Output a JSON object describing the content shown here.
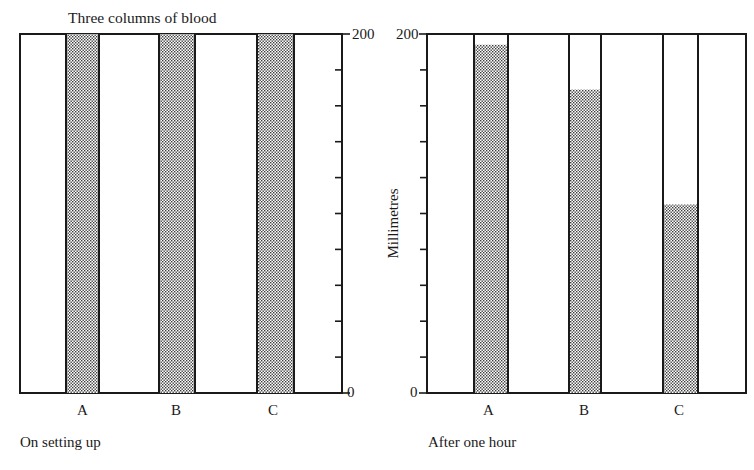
{
  "figure": {
    "title": "Three columns of blood",
    "y_axis_label": "Millimetres",
    "colors": {
      "ink": "#1a1a1a",
      "stipple": "#3a3a3a",
      "background": "#ffffff"
    }
  },
  "panels": [
    {
      "caption": "On setting up",
      "y_ticks": {
        "top": "200",
        "bottom": "0"
      },
      "columns": [
        {
          "label": "A",
          "fill_mm": 200
        },
        {
          "label": "B",
          "fill_mm": 200
        },
        {
          "label": "C",
          "fill_mm": 200
        }
      ]
    },
    {
      "caption": "After one hour",
      "y_ticks": {
        "top": "200",
        "bottom": "0"
      },
      "columns": [
        {
          "label": "A",
          "fill_mm": 194
        },
        {
          "label": "B",
          "fill_mm": 169
        },
        {
          "label": "C",
          "fill_mm": 105
        }
      ]
    }
  ],
  "chart_data": {
    "type": "bar",
    "title": "Three columns of blood",
    "xlabel": "",
    "ylabel": "Millimetres",
    "ylim": [
      0,
      200
    ],
    "y_tick_interval": 20,
    "categories": [
      "A",
      "B",
      "C"
    ],
    "series": [
      {
        "name": "On setting up",
        "values": [
          200,
          200,
          200
        ]
      },
      {
        "name": "After one hour",
        "values": [
          194,
          169,
          105
        ]
      }
    ],
    "grid": false,
    "legend": "captions below each panel"
  }
}
